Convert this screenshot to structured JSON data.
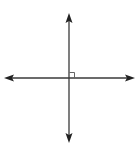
{
  "diagram": {
    "type": "perpendicular-lines",
    "colors": {
      "background": "#ffffff",
      "line": "#3a3a3a",
      "arrow": "#222222"
    },
    "intersection": {
      "x": 69,
      "y": 78
    },
    "vertical_line": {
      "x": 69,
      "y1": 13,
      "y2": 143,
      "arrows": [
        "up",
        "down"
      ]
    },
    "horizontal_line": {
      "y": 78,
      "x1": 4,
      "x2": 135,
      "arrows": [
        "left",
        "right"
      ]
    },
    "right_angle_marker": {
      "quadrant": "upper-right",
      "size": 5
    }
  }
}
